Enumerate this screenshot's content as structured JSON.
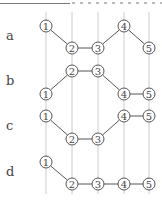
{
  "colors": {
    "guide": "#cccccc",
    "node_stroke": "#555555",
    "edge": "#555555",
    "text": "#444444"
  },
  "columns_x": [
    46,
    72,
    98,
    124,
    149
  ],
  "guide_top": 12,
  "guide_bottom": 194,
  "node_radius": 6,
  "rows": [
    {
      "label": "a",
      "label_y": 37,
      "nodes": [
        {
          "id": "1",
          "col": 0,
          "y": 26
        },
        {
          "id": "2",
          "col": 1,
          "y": 48
        },
        {
          "id": "3",
          "col": 2,
          "y": 48
        },
        {
          "id": "4",
          "col": 3,
          "y": 26
        },
        {
          "id": "5",
          "col": 4,
          "y": 48
        }
      ]
    },
    {
      "label": "b",
      "label_y": 82,
      "nodes": [
        {
          "id": "1",
          "col": 0,
          "y": 94
        },
        {
          "id": "2",
          "col": 1,
          "y": 71
        },
        {
          "id": "3",
          "col": 2,
          "y": 71
        },
        {
          "id": "4",
          "col": 3,
          "y": 94
        },
        {
          "id": "5",
          "col": 4,
          "y": 94
        }
      ]
    },
    {
      "label": "c",
      "label_y": 127,
      "nodes": [
        {
          "id": "1",
          "col": 0,
          "y": 116
        },
        {
          "id": "2",
          "col": 1,
          "y": 139
        },
        {
          "id": "3",
          "col": 2,
          "y": 139
        },
        {
          "id": "4",
          "col": 3,
          "y": 116
        },
        {
          "id": "5",
          "col": 4,
          "y": 116
        }
      ]
    },
    {
      "label": "d",
      "label_y": 173,
      "nodes": [
        {
          "id": "1",
          "col": 0,
          "y": 162
        },
        {
          "id": "2",
          "col": 1,
          "y": 184
        },
        {
          "id": "3",
          "col": 2,
          "y": 184
        },
        {
          "id": "4",
          "col": 3,
          "y": 184
        },
        {
          "id": "5",
          "col": 4,
          "y": 184
        }
      ]
    }
  ]
}
